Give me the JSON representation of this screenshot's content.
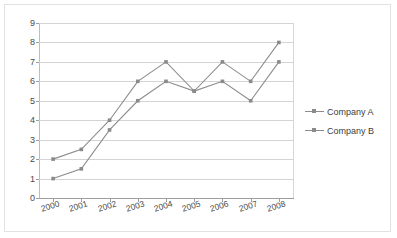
{
  "chart_data": {
    "type": "line",
    "title": "",
    "xlabel": "",
    "ylabel": "",
    "categories": [
      "2000",
      "2001",
      "2002",
      "2003",
      "2004",
      "2005",
      "2006",
      "2007",
      "2008"
    ],
    "series": [
      {
        "name": "Company A",
        "values": [
          1,
          1.5,
          3.5,
          5,
          6,
          5.5,
          6,
          5,
          7
        ],
        "color": "#8c8c8c",
        "marker": "square"
      },
      {
        "name": "Company B",
        "values": [
          2,
          2.5,
          4,
          6,
          7,
          5.5,
          7,
          6,
          8
        ],
        "color": "#8c8c8c",
        "marker": "square"
      }
    ],
    "ylim": [
      0,
      9
    ],
    "ytick_labels": [
      "9",
      "8",
      "7",
      "6",
      "5",
      "4",
      "3",
      "2",
      "1",
      "0"
    ],
    "ytick_values": [
      9,
      8,
      7,
      6,
      5,
      4,
      3,
      2,
      1,
      0
    ],
    "grid": true,
    "grid_axis": "y",
    "legend_position": "right",
    "legend": [
      "Company A",
      "Company B"
    ],
    "xtick_rotation": -17,
    "plot_background": "#ffffff",
    "grid_color": "#d4d4d4",
    "axis_color": "#9d9d9d",
    "border_color": "#e2e2e2"
  }
}
